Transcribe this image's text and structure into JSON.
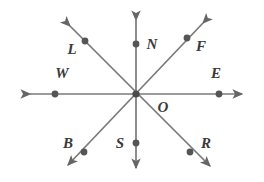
{
  "figure": {
    "background_color": "#ffffff",
    "line_color": "#7a7a7a",
    "point_color": "#555555",
    "label_color": "#3a3a3a",
    "center": {
      "label": "O",
      "x": 136,
      "y": 94
    },
    "lines": [
      {
        "name": "horizontal-line-we",
        "from": "W",
        "to": "E",
        "x1": 28,
        "y1": 94,
        "x2": 244,
        "y2": 94
      },
      {
        "name": "vertical-line-ns",
        "from": "N",
        "to": "S",
        "x1": 136,
        "y1": 18,
        "x2": 136,
        "y2": 170
      },
      {
        "name": "diagonal-line-lr",
        "from": "L",
        "to": "R",
        "x1": 68,
        "y1": 24,
        "x2": 212,
        "y2": 170
      },
      {
        "name": "diagonal-line-fb",
        "from": "F",
        "to": "B",
        "x1": 205,
        "y1": 21,
        "x2": 66,
        "y2": 168
      }
    ],
    "points": [
      {
        "label": "L",
        "dot_x": 85,
        "dot_y": 41,
        "label_x": 72,
        "label_y": 49,
        "ray": "upper-left"
      },
      {
        "label": "N",
        "dot_x": 136,
        "dot_y": 44,
        "label_x": 152,
        "label_y": 44,
        "ray": "up"
      },
      {
        "label": "F",
        "dot_x": 187,
        "dot_y": 38,
        "label_x": 201,
        "label_y": 46,
        "ray": "upper-right"
      },
      {
        "label": "W",
        "dot_x": 55,
        "dot_y": 94,
        "label_x": 62,
        "label_y": 73,
        "ray": "left"
      },
      {
        "label": "E",
        "dot_x": 219,
        "dot_y": 94,
        "label_x": 216,
        "label_y": 73,
        "ray": "right"
      },
      {
        "label": "B",
        "dot_x": 84,
        "dot_y": 152,
        "label_x": 68,
        "label_y": 143,
        "ray": "lower-left"
      },
      {
        "label": "S",
        "dot_x": 136,
        "dot_y": 143,
        "label_x": 120,
        "label_y": 143,
        "ray": "down"
      },
      {
        "label": "R",
        "dot_x": 190,
        "dot_y": 152,
        "label_x": 206,
        "label_y": 143,
        "ray": "lower-right"
      },
      {
        "label": "O",
        "dot_x": 136,
        "dot_y": 94,
        "label_x": 163,
        "label_y": 107,
        "ray": "center"
      }
    ],
    "point_radius": 3.4,
    "center_radius": 3.6,
    "stroke_width": 1.7
  }
}
